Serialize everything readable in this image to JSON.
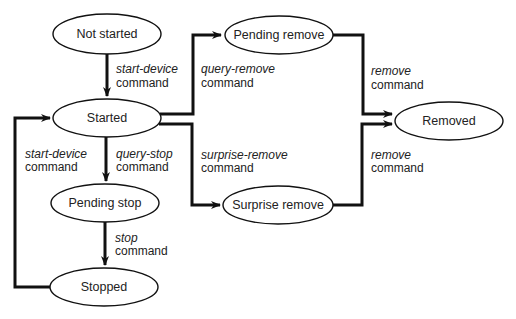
{
  "diagram": {
    "type": "state-diagram",
    "colors": {
      "stroke": "#111111",
      "node_fill": "#ffffff",
      "text": "#222222",
      "background": "#ffffff"
    },
    "nodes": [
      {
        "id": "not_started",
        "label": "Not started"
      },
      {
        "id": "started",
        "label": "Started"
      },
      {
        "id": "pending_remove",
        "label": "Pending remove"
      },
      {
        "id": "removed",
        "label": "Removed"
      },
      {
        "id": "surprise_remove",
        "label": "Surprise remove"
      },
      {
        "id": "pending_stop",
        "label": "Pending stop"
      },
      {
        "id": "stopped",
        "label": "Stopped"
      }
    ],
    "edges": [
      {
        "from": "not_started",
        "to": "started",
        "command": "start-device",
        "suffix": "command"
      },
      {
        "from": "started",
        "to": "pending_remove",
        "command": "query-remove",
        "suffix": "command"
      },
      {
        "from": "pending_remove",
        "to": "removed",
        "command": "remove",
        "suffix": "command"
      },
      {
        "from": "started",
        "to": "surprise_remove",
        "command": "surprise-remove",
        "suffix": "command"
      },
      {
        "from": "surprise_remove",
        "to": "removed",
        "command": "remove",
        "suffix": "command"
      },
      {
        "from": "started",
        "to": "pending_stop",
        "command": "query-stop",
        "suffix": "command"
      },
      {
        "from": "pending_stop",
        "to": "stopped",
        "command": "stop",
        "suffix": "command"
      },
      {
        "from": "stopped",
        "to": "started",
        "command": "start-device",
        "suffix": "command"
      }
    ]
  }
}
